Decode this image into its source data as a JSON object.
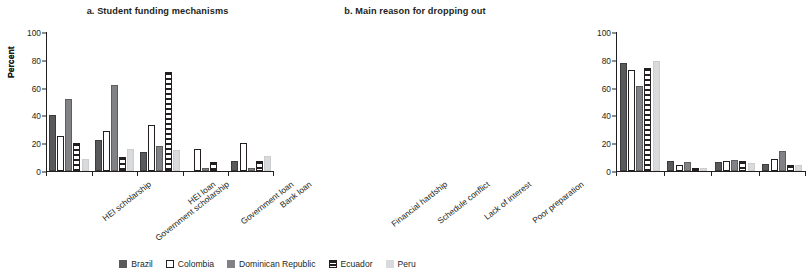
{
  "figure": {
    "ylabel": "Percent",
    "ytick_labels": [
      "0",
      "20",
      "40",
      "60",
      "80",
      "100"
    ]
  },
  "legend": {
    "position": "bottom-center",
    "entries": [
      {
        "label": "Brazil",
        "key": "brazil",
        "color": "#58595b",
        "style": "solid-dark-gray"
      },
      {
        "label": "Colombia",
        "key": "colombia",
        "color": "#ffffff",
        "style": "white-outlined"
      },
      {
        "label": "Dominican Republic",
        "key": "dominican",
        "color": "#808285",
        "style": "solid-medium-gray"
      },
      {
        "label": "Ecuador",
        "key": "ecuador",
        "color": "#231f20",
        "style": "horizontal-stripes"
      },
      {
        "label": "Peru",
        "key": "peru",
        "color": "#d9dadb",
        "style": "solid-light-gray"
      }
    ]
  },
  "chart_data": [
    {
      "type": "bar",
      "id": "panel-a",
      "title": "a. Student funding mechanisms",
      "xlabel": "",
      "ylabel": "Percent",
      "ylim": [
        0,
        100
      ],
      "yticks": [
        0,
        20,
        40,
        60,
        80,
        100
      ],
      "grid": false,
      "legend": "bottom-center",
      "categories": [
        "HEI scholarship",
        "Government scholarship",
        "HEI loan",
        "Government loan",
        "Bank loan"
      ],
      "series": [
        {
          "name": "Brazil",
          "key": "brazil",
          "values": [
            40,
            22.5,
            13.5,
            0,
            7
          ]
        },
        {
          "name": "Colombia",
          "key": "colombia",
          "values": [
            25.5,
            29,
            33,
            15.5,
            20
          ]
        },
        {
          "name": "Dominican Republic",
          "key": "dominican",
          "values": [
            52,
            62,
            18,
            2.5,
            2.5
          ]
        },
        {
          "name": "Ecuador",
          "key": "ecuador",
          "values": [
            20,
            10,
            71,
            6.5,
            7
          ]
        },
        {
          "name": "Peru",
          "key": "peru",
          "values": [
            9,
            16,
            15,
            0,
            11
          ]
        }
      ]
    },
    {
      "type": "bar",
      "id": "panel-b",
      "title": "b. Main reason for dropping out",
      "xlabel": "",
      "ylabel": "Percent",
      "ylim": [
        0,
        100
      ],
      "yticks": [
        0,
        20,
        40,
        60,
        80,
        100
      ],
      "grid": false,
      "legend": "bottom-center",
      "categories": [
        "Financial hardship",
        "Schedule conflict",
        "Lack of interest",
        "Poor preparation"
      ],
      "series": [
        {
          "name": "Brazil",
          "key": "brazil",
          "values": [
            77.5,
            7,
            6.5,
            5
          ]
        },
        {
          "name": "Colombia",
          "key": "colombia",
          "values": [
            73,
            4.5,
            7.5,
            8.5
          ]
        },
        {
          "name": "Dominican Republic",
          "key": "dominican",
          "values": [
            61.5,
            6.5,
            8,
            14.5
          ]
        },
        {
          "name": "Ecuador",
          "key": "ecuador",
          "values": [
            74,
            2.5,
            7,
            4.5
          ]
        },
        {
          "name": "Peru",
          "key": "peru",
          "values": [
            79.5,
            2,
            5.5,
            4
          ]
        }
      ]
    }
  ]
}
